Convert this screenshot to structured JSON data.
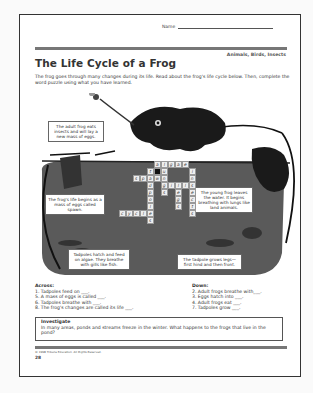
{
  "header": {
    "name_label": "Name",
    "category": "Animals, Birds, Insects",
    "title": "The Life Cycle of a Frog",
    "intro": "The frog goes through many changes during its life. Read about the frog's life cycle below. Then, complete the word puzzle using what you have learned."
  },
  "illustration": {
    "captions": {
      "adult": "The adult frog eats insects and will lay a new mass of eggs.",
      "spawn": "The frog's life begins as a mass of eggs called spawn.",
      "young": "The young frog leaves the water. It begins breathing with lungs like land animals.",
      "tadpole_hatch": "Tadpoles hatch and feed on algae. They breathe with gills like fish.",
      "tadpole_legs": "The tadpole grows legs—first hind and then front."
    },
    "colors": {
      "pond": "#555555",
      "frog": "#1a1a1a",
      "grass": "#333333"
    }
  },
  "crossword": {
    "cells": [
      {
        "r": 0,
        "c": 5,
        "ch": "a"
      },
      {
        "r": 0,
        "c": 6,
        "ch": "l"
      },
      {
        "r": 0,
        "c": 7,
        "ch": "g"
      },
      {
        "r": 0,
        "c": 8,
        "ch": "a"
      },
      {
        "r": 0,
        "c": 9,
        "ch": "e"
      },
      {
        "r": 1,
        "c": 4,
        "ch": "t"
      },
      {
        "r": 1,
        "c": 5,
        "ch": "",
        "black": true
      },
      {
        "r": 1,
        "c": 6,
        "ch": "u"
      },
      {
        "r": 1,
        "c": 10,
        "ch": "i"
      },
      {
        "r": 2,
        "c": 2,
        "ch": "s"
      },
      {
        "r": 2,
        "c": 3,
        "ch": "p"
      },
      {
        "r": 2,
        "c": 4,
        "ch": "a"
      },
      {
        "r": 2,
        "c": 5,
        "ch": "w"
      },
      {
        "r": 2,
        "c": 6,
        "ch": "n"
      },
      {
        "r": 2,
        "c": 10,
        "ch": "n"
      },
      {
        "r": 3,
        "c": 4,
        "ch": "d"
      },
      {
        "r": 3,
        "c": 6,
        "ch": "g"
      },
      {
        "r": 3,
        "c": 7,
        "ch": "i"
      },
      {
        "r": 3,
        "c": 8,
        "ch": "l"
      },
      {
        "r": 3,
        "c": 9,
        "ch": "l"
      },
      {
        "r": 3,
        "c": 10,
        "ch": "s"
      },
      {
        "r": 4,
        "c": 4,
        "ch": "p"
      },
      {
        "r": 4,
        "c": 6,
        "ch": "s"
      },
      {
        "r": 4,
        "c": 8,
        "ch": "e"
      },
      {
        "r": 4,
        "c": 10,
        "ch": "e"
      },
      {
        "r": 5,
        "c": 4,
        "ch": "o"
      },
      {
        "r": 5,
        "c": 8,
        "ch": "g"
      },
      {
        "r": 5,
        "c": 10,
        "ch": "c"
      },
      {
        "r": 6,
        "c": 4,
        "ch": "l"
      },
      {
        "r": 6,
        "c": 8,
        "ch": "s"
      },
      {
        "r": 6,
        "c": 10,
        "ch": "t"
      },
      {
        "r": 7,
        "c": 0,
        "ch": "c"
      },
      {
        "r": 7,
        "c": 1,
        "ch": "y"
      },
      {
        "r": 7,
        "c": 2,
        "ch": "c"
      },
      {
        "r": 7,
        "c": 3,
        "ch": "l"
      },
      {
        "r": 7,
        "c": 4,
        "ch": "e"
      },
      {
        "r": 7,
        "c": 10,
        "ch": "s"
      },
      {
        "r": 8,
        "c": 4,
        "ch": "s"
      }
    ]
  },
  "clues": {
    "across_label": "Across:",
    "across": [
      "1. Tadpoles feed on ___.",
      "5. A mass of eggs is called ___.",
      "6. Tadpoles breathe with ___.",
      "8. The frog's changes are called its life ___."
    ],
    "down_label": "Down:",
    "down": [
      "2. Adult frogs breathe with___.",
      "3. Eggs hatch into ___.",
      "4. Adult frogs eat ___.",
      "7. Tadpoles grow ___."
    ]
  },
  "investigate": {
    "label": "Investigate",
    "text": "In many areas, ponds and streams freeze in the winter. What happens to the frogs that live in the pond?"
  },
  "footer": {
    "copyright": "© 1998 Tribune Education. All Rights Reserved.",
    "page_number": "28"
  }
}
